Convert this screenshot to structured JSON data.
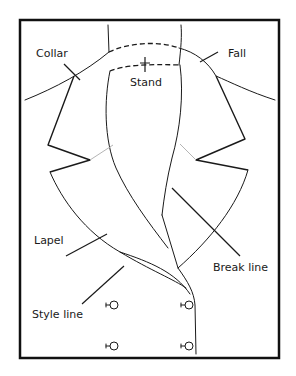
{
  "diagram": {
    "labels": {
      "collar": "Collar",
      "fall": "Fall",
      "stand": "Stand",
      "lapel": "Lapel",
      "break_line": "Break line",
      "style_line": "Style line"
    },
    "colors": {
      "line": "#1a1a1a",
      "frame": "#111111",
      "seam_hint": "#b5b5b5",
      "background": "#ffffff"
    },
    "buttons": [
      {
        "row": 1,
        "side": "left"
      },
      {
        "row": 1,
        "side": "right"
      },
      {
        "row": 2,
        "side": "left"
      },
      {
        "row": 2,
        "side": "right"
      }
    ]
  }
}
